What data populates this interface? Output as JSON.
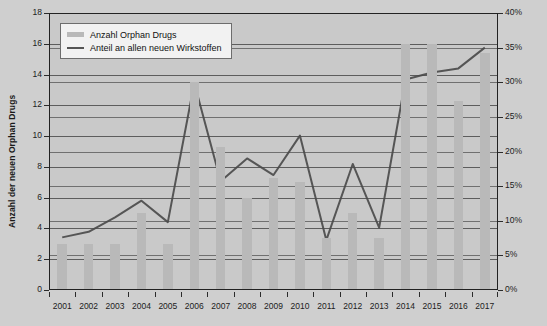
{
  "chart_data": {
    "type": "bar",
    "title": "",
    "subtitle": "",
    "xlabel": "",
    "ylabel": "Anzahl der neuen Orphan Drugs",
    "ylabel_right": "Anteil von Orphan Drugs an allen neuen Wirkstoffen",
    "categories": [
      "2001",
      "2002",
      "2003",
      "2004",
      "2005",
      "2006",
      "2007",
      "2008",
      "2009",
      "2010",
      "2011",
      "2012",
      "2013",
      "2014",
      "2015",
      "2016",
      "2017"
    ],
    "ylim": [
      0,
      18
    ],
    "ylim_right": [
      0,
      40
    ],
    "ytick_labels": [
      "0",
      "2",
      "4",
      "6",
      "8",
      "10",
      "12",
      "14",
      "16",
      "18"
    ],
    "ytick_values": [
      0,
      2,
      4,
      6,
      8,
      10,
      12,
      14,
      16,
      18
    ],
    "ytick_labels_right": [
      "0%",
      "5%",
      "10%",
      "15%",
      "20%",
      "25%",
      "30%",
      "35%",
      "40%"
    ],
    "ytick_values_right": [
      0,
      5,
      10,
      15,
      20,
      25,
      30,
      35,
      40
    ],
    "grid": true,
    "legend_position": "top-left",
    "series": [
      {
        "name": "Anzahl Orphan Drugs",
        "type": "bar",
        "axis": "left",
        "color": "#b9b9b9",
        "values": [
          3,
          3,
          3,
          5,
          3,
          13.5,
          9.3,
          6,
          7.3,
          7,
          3.4,
          5,
          3.4,
          16,
          16,
          12.3,
          15.4
        ]
      },
      {
        "name": "Anteil an allen neuen Wirkstoffen",
        "type": "line",
        "axis": "right",
        "color": "#555555",
        "values": [
          7.6,
          8.4,
          10.5,
          12.9,
          9.8,
          29.9,
          15.7,
          19.0,
          16.6,
          22.3,
          7.2,
          18.2,
          9.0,
          30.4,
          31.4,
          32.0,
          35.0
        ]
      }
    ]
  },
  "legend": {
    "items": [
      {
        "label": "Anzahl Orphan Drugs",
        "marker": "bar-swatch"
      },
      {
        "label": "Anteil an allen neuen Wirkstoffen",
        "marker": "line-swatch"
      }
    ]
  },
  "axes": {
    "left_title": "Anzahl der neuen Orphan Drugs",
    "right_title": "Anteil von Orphan Drugs an allen neuen Wirkstoffen"
  },
  "colors": {
    "background": "#cfcfcf",
    "plot_background": "#c9c9c9",
    "bar": "#b9b9b9",
    "line": "#555555",
    "grid": "#4a4a4a",
    "axis": "#222222",
    "legend_background": "#f2f2f2"
  }
}
